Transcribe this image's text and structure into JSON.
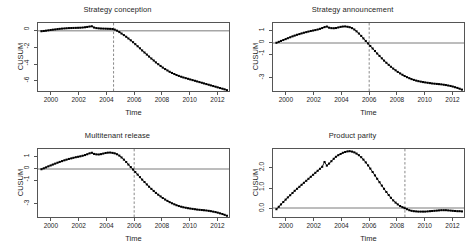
{
  "figure": {
    "layout": "2x2 grid of CUSUM panels",
    "background": "#ffffff",
    "axis_color": "#555555",
    "point_color": "#000000",
    "reference_line_color": "#555555",
    "event_line_color": "#666666"
  },
  "chart_data": [
    {
      "type": "line",
      "title": "Strategy conception",
      "xlabel": "Time",
      "ylabel": "CUSUM",
      "xlim": [
        1999.0,
        2012.9
      ],
      "ylim": [
        -7.3,
        0.95
      ],
      "xticks": [
        2000,
        2002,
        2004,
        2006,
        2008,
        2010,
        2012
      ],
      "yticks": [
        0,
        -2,
        -4,
        -6
      ],
      "ytick_labels": [
        "0",
        "-2",
        "-4",
        "-6"
      ],
      "grid": false,
      "legend": "none",
      "markers": "filled-square",
      "annotations": [
        {
          "kind": "hline",
          "y": 0,
          "style": "solid"
        },
        {
          "kind": "vline",
          "x": 2004.5,
          "style": "dashed",
          "label": "intervention"
        }
      ],
      "x": [
        1999.25,
        1999.42,
        1999.58,
        1999.75,
        1999.92,
        2000.08,
        2000.25,
        2000.42,
        2000.58,
        2000.75,
        2000.92,
        2001.08,
        2001.25,
        2001.42,
        2001.58,
        2001.75,
        2001.92,
        2002.08,
        2002.25,
        2002.42,
        2002.58,
        2002.75,
        2002.92,
        2003.08,
        2003.25,
        2003.42,
        2003.58,
        2003.75,
        2003.92,
        2004.08,
        2004.25,
        2004.42,
        2004.58,
        2004.75,
        2004.92,
        2005.08,
        2005.25,
        2005.42,
        2005.58,
        2005.75,
        2005.92,
        2006.08,
        2006.25,
        2006.42,
        2006.58,
        2006.75,
        2006.92,
        2007.08,
        2007.25,
        2007.42,
        2007.58,
        2007.75,
        2007.92,
        2008.08,
        2008.25,
        2008.42,
        2008.58,
        2008.75,
        2008.92,
        2009.08,
        2009.25,
        2009.42,
        2009.58,
        2009.75,
        2009.92,
        2010.08,
        2010.25,
        2010.42,
        2010.58,
        2010.75,
        2010.92,
        2011.08,
        2011.25,
        2011.42,
        2011.58,
        2011.75,
        2011.92,
        2012.08,
        2012.25,
        2012.42,
        2012.58,
        2012.75
      ],
      "y": [
        -0.05,
        -0.02,
        0.02,
        0.06,
        0.1,
        0.14,
        0.17,
        0.21,
        0.24,
        0.27,
        0.29,
        0.31,
        0.33,
        0.34,
        0.35,
        0.36,
        0.37,
        0.38,
        0.4,
        0.43,
        0.47,
        0.52,
        0.55,
        0.4,
        0.33,
        0.3,
        0.28,
        0.27,
        0.26,
        0.25,
        0.24,
        0.22,
        0.15,
        0.02,
        -0.15,
        -0.33,
        -0.52,
        -0.72,
        -0.93,
        -1.15,
        -1.38,
        -1.62,
        -1.87,
        -2.12,
        -2.38,
        -2.63,
        -2.88,
        -3.12,
        -3.36,
        -3.6,
        -3.83,
        -4.05,
        -4.26,
        -4.46,
        -4.64,
        -4.81,
        -4.97,
        -5.11,
        -5.24,
        -5.36,
        -5.47,
        -5.57,
        -5.66,
        -5.74,
        -5.82,
        -5.9,
        -5.98,
        -6.06,
        -6.14,
        -6.22,
        -6.3,
        -6.38,
        -6.46,
        -6.54,
        -6.62,
        -6.7,
        -6.78,
        -6.86,
        -6.94,
        -7.02,
        -7.1,
        -7.2
      ]
    },
    {
      "type": "line",
      "title": "Strategy announcement",
      "xlabel": "Time",
      "ylabel": "CUSUM",
      "xlim": [
        1999.0,
        2012.9
      ],
      "ylim": [
        -4.2,
        1.75
      ],
      "xticks": [
        2000,
        2002,
        2004,
        2006,
        2008,
        2010,
        2012
      ],
      "yticks": [
        1,
        0,
        -1,
        -3
      ],
      "ytick_labels": [
        "1",
        "0",
        "-1",
        "-3"
      ],
      "grid": false,
      "legend": "none",
      "markers": "filled-square",
      "annotations": [
        {
          "kind": "hline",
          "y": 0,
          "style": "solid"
        },
        {
          "kind": "vline",
          "x": 2006.0,
          "style": "dashed",
          "label": "intervention"
        }
      ],
      "x": [
        1999.25,
        1999.42,
        1999.58,
        1999.75,
        1999.92,
        2000.08,
        2000.25,
        2000.42,
        2000.58,
        2000.75,
        2000.92,
        2001.08,
        2001.25,
        2001.42,
        2001.58,
        2001.75,
        2001.92,
        2002.08,
        2002.25,
        2002.42,
        2002.58,
        2002.75,
        2002.92,
        2003.08,
        2003.25,
        2003.42,
        2003.58,
        2003.75,
        2003.92,
        2004.08,
        2004.25,
        2004.42,
        2004.58,
        2004.75,
        2004.92,
        2005.08,
        2005.25,
        2005.42,
        2005.58,
        2005.75,
        2005.92,
        2006.08,
        2006.25,
        2006.42,
        2006.58,
        2006.75,
        2006.92,
        2007.08,
        2007.25,
        2007.42,
        2007.58,
        2007.75,
        2007.92,
        2008.08,
        2008.25,
        2008.42,
        2008.58,
        2008.75,
        2008.92,
        2009.08,
        2009.25,
        2009.42,
        2009.58,
        2009.75,
        2009.92,
        2010.08,
        2010.25,
        2010.42,
        2010.58,
        2010.75,
        2010.92,
        2011.08,
        2011.25,
        2011.42,
        2011.58,
        2011.75,
        2011.92,
        2012.08,
        2012.25,
        2012.42,
        2012.58,
        2012.75
      ],
      "y": [
        0.02,
        0.1,
        0.18,
        0.26,
        0.34,
        0.42,
        0.5,
        0.58,
        0.65,
        0.72,
        0.78,
        0.84,
        0.9,
        0.95,
        1.0,
        1.05,
        1.09,
        1.13,
        1.18,
        1.24,
        1.31,
        1.39,
        1.44,
        1.34,
        1.3,
        1.29,
        1.31,
        1.36,
        1.41,
        1.44,
        1.45,
        1.42,
        1.38,
        1.3,
        1.18,
        1.02,
        0.83,
        0.62,
        0.4,
        0.18,
        -0.04,
        -0.26,
        -0.48,
        -0.7,
        -0.92,
        -1.13,
        -1.34,
        -1.54,
        -1.73,
        -1.91,
        -2.08,
        -2.24,
        -2.39,
        -2.53,
        -2.66,
        -2.78,
        -2.89,
        -2.99,
        -3.08,
        -3.16,
        -3.23,
        -3.29,
        -3.34,
        -3.38,
        -3.42,
        -3.45,
        -3.48,
        -3.51,
        -3.54,
        -3.56,
        -3.58,
        -3.6,
        -3.62,
        -3.65,
        -3.68,
        -3.72,
        -3.76,
        -3.81,
        -3.87,
        -3.93,
        -4.0,
        -4.08
      ]
    },
    {
      "type": "line",
      "title": "Multitenant release",
      "xlabel": "Time",
      "ylabel": "CUSUM",
      "xlim": [
        1999.0,
        2012.9
      ],
      "ylim": [
        -4.2,
        1.75
      ],
      "xticks": [
        2000,
        2002,
        2004,
        2006,
        2008,
        2010,
        2012
      ],
      "yticks": [
        1,
        0,
        -1,
        -3
      ],
      "ytick_labels": [
        "1",
        "0",
        "-1",
        "-3"
      ],
      "grid": false,
      "legend": "none",
      "markers": "filled-square",
      "annotations": [
        {
          "kind": "hline",
          "y": 0,
          "style": "solid"
        },
        {
          "kind": "vline",
          "x": 2006.0,
          "style": "dashed",
          "label": "intervention"
        }
      ],
      "x": [
        1999.25,
        1999.42,
        1999.58,
        1999.75,
        1999.92,
        2000.08,
        2000.25,
        2000.42,
        2000.58,
        2000.75,
        2000.92,
        2001.08,
        2001.25,
        2001.42,
        2001.58,
        2001.75,
        2001.92,
        2002.08,
        2002.25,
        2002.42,
        2002.58,
        2002.75,
        2002.92,
        2003.08,
        2003.25,
        2003.42,
        2003.58,
        2003.75,
        2003.92,
        2004.08,
        2004.25,
        2004.42,
        2004.58,
        2004.75,
        2004.92,
        2005.08,
        2005.25,
        2005.42,
        2005.58,
        2005.75,
        2005.92,
        2006.08,
        2006.25,
        2006.42,
        2006.58,
        2006.75,
        2006.92,
        2007.08,
        2007.25,
        2007.42,
        2007.58,
        2007.75,
        2007.92,
        2008.08,
        2008.25,
        2008.42,
        2008.58,
        2008.75,
        2008.92,
        2009.08,
        2009.25,
        2009.42,
        2009.58,
        2009.75,
        2009.92,
        2010.08,
        2010.25,
        2010.42,
        2010.58,
        2010.75,
        2010.92,
        2011.08,
        2011.25,
        2011.42,
        2011.58,
        2011.75,
        2011.92,
        2012.08,
        2012.25,
        2012.42,
        2012.58,
        2012.75
      ],
      "y": [
        -0.02,
        0.06,
        0.14,
        0.23,
        0.31,
        0.39,
        0.47,
        0.55,
        0.62,
        0.69,
        0.76,
        0.82,
        0.88,
        0.93,
        0.98,
        1.03,
        1.07,
        1.11,
        1.16,
        1.22,
        1.29,
        1.37,
        1.42,
        1.32,
        1.28,
        1.27,
        1.3,
        1.35,
        1.4,
        1.43,
        1.44,
        1.41,
        1.37,
        1.29,
        1.17,
        1.01,
        0.82,
        0.61,
        0.39,
        0.17,
        -0.05,
        -0.27,
        -0.49,
        -0.71,
        -0.93,
        -1.14,
        -1.35,
        -1.55,
        -1.74,
        -1.92,
        -2.09,
        -2.25,
        -2.4,
        -2.54,
        -2.67,
        -2.79,
        -2.9,
        -3.0,
        -3.09,
        -3.17,
        -3.24,
        -3.3,
        -3.35,
        -3.39,
        -3.43,
        -3.46,
        -3.49,
        -3.52,
        -3.55,
        -3.57,
        -3.59,
        -3.61,
        -3.63,
        -3.66,
        -3.69,
        -3.73,
        -3.77,
        -3.82,
        -3.88,
        -3.94,
        -4.01,
        -4.09
      ]
    },
    {
      "type": "line",
      "title": "Product parity",
      "xlabel": "Time",
      "ylabel": "CUSUM",
      "xlim": [
        1999.0,
        2012.9
      ],
      "ylim": [
        -0.45,
        2.95
      ],
      "xticks": [
        2000,
        2002,
        2004,
        2006,
        2008,
        2010,
        2012
      ],
      "yticks": [
        2.0,
        1.0,
        0.0
      ],
      "ytick_labels": [
        "2.0",
        "1.0",
        "0.0"
      ],
      "grid": false,
      "legend": "none",
      "markers": "filled-square",
      "annotations": [
        {
          "kind": "hline",
          "y": 0,
          "style": "solid"
        },
        {
          "kind": "vline",
          "x": 2008.6,
          "style": "dashed",
          "label": "intervention"
        }
      ],
      "x": [
        1999.25,
        1999.42,
        1999.58,
        1999.75,
        1999.92,
        2000.08,
        2000.25,
        2000.42,
        2000.58,
        2000.75,
        2000.92,
        2001.08,
        2001.25,
        2001.42,
        2001.58,
        2001.75,
        2001.92,
        2002.08,
        2002.25,
        2002.42,
        2002.58,
        2002.75,
        2002.92,
        2003.08,
        2003.25,
        2003.42,
        2003.58,
        2003.75,
        2003.92,
        2004.08,
        2004.25,
        2004.42,
        2004.58,
        2004.75,
        2004.92,
        2005.08,
        2005.25,
        2005.42,
        2005.58,
        2005.75,
        2005.92,
        2006.08,
        2006.25,
        2006.42,
        2006.58,
        2006.75,
        2006.92,
        2007.08,
        2007.25,
        2007.42,
        2007.58,
        2007.75,
        2007.92,
        2008.08,
        2008.25,
        2008.42,
        2008.58,
        2008.75,
        2008.92,
        2009.08,
        2009.25,
        2009.42,
        2009.58,
        2009.75,
        2009.92,
        2010.08,
        2010.25,
        2010.42,
        2010.58,
        2010.75,
        2010.92,
        2011.08,
        2011.25,
        2011.42,
        2011.58,
        2011.75,
        2011.92,
        2012.08,
        2012.25,
        2012.42,
        2012.58,
        2012.75
      ],
      "y": [
        -0.06,
        0.06,
        0.18,
        0.3,
        0.42,
        0.53,
        0.64,
        0.75,
        0.86,
        0.96,
        1.06,
        1.16,
        1.26,
        1.36,
        1.46,
        1.56,
        1.66,
        1.76,
        1.86,
        1.96,
        2.06,
        2.3,
        2.12,
        2.22,
        2.34,
        2.46,
        2.56,
        2.64,
        2.7,
        2.76,
        2.8,
        2.83,
        2.84,
        2.82,
        2.78,
        2.72,
        2.64,
        2.54,
        2.42,
        2.28,
        2.13,
        1.97,
        1.8,
        1.63,
        1.46,
        1.29,
        1.12,
        0.96,
        0.8,
        0.65,
        0.51,
        0.38,
        0.27,
        0.18,
        0.1,
        0.04,
        -0.01,
        -0.06,
        -0.11,
        -0.14,
        -0.16,
        -0.17,
        -0.18,
        -0.18,
        -0.18,
        -0.18,
        -0.17,
        -0.16,
        -0.15,
        -0.14,
        -0.13,
        -0.12,
        -0.11,
        -0.11,
        -0.11,
        -0.12,
        -0.13,
        -0.14,
        -0.15,
        -0.16,
        -0.16,
        -0.17
      ]
    }
  ]
}
